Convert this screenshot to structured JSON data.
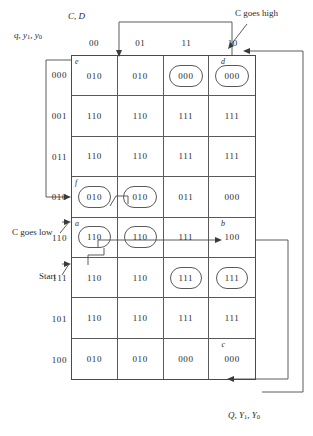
{
  "figure": {
    "caption_top_left_rows": "q, y1, y0",
    "caption_top_left_cols": "C, D",
    "caption_bottom_right": "Q, Y1, Y0"
  },
  "annotations": {
    "c_goes_high": "C goes high",
    "c_goes_low": "C goes low",
    "start": "Start"
  },
  "kmap": {
    "column_headers": [
      "00",
      "01",
      "11",
      "10"
    ],
    "row_headers": [
      "000",
      "001",
      "011",
      "010",
      "110",
      "111",
      "101",
      "100"
    ],
    "rows": [
      {
        "label": "000",
        "cells": [
          {
            "value": "010",
            "circled": false,
            "tag": "e"
          },
          {
            "value": "010",
            "circled": false,
            "tag": ""
          },
          {
            "value": "000",
            "circled": true,
            "tag": ""
          },
          {
            "value": "000",
            "circled": true,
            "tag": "d"
          }
        ]
      },
      {
        "label": "001",
        "cells": [
          {
            "value": "110",
            "circled": false,
            "tag": ""
          },
          {
            "value": "110",
            "circled": false,
            "tag": ""
          },
          {
            "value": "111",
            "circled": false,
            "tag": ""
          },
          {
            "value": "111",
            "circled": false,
            "tag": ""
          }
        ]
      },
      {
        "label": "011",
        "cells": [
          {
            "value": "110",
            "circled": false,
            "tag": ""
          },
          {
            "value": "110",
            "circled": false,
            "tag": ""
          },
          {
            "value": "111",
            "circled": false,
            "tag": ""
          },
          {
            "value": "111",
            "circled": false,
            "tag": ""
          }
        ]
      },
      {
        "label": "010",
        "cells": [
          {
            "value": "010",
            "circled": true,
            "tag": "f"
          },
          {
            "value": "010",
            "circled": true,
            "tag": ""
          },
          {
            "value": "011",
            "circled": false,
            "tag": ""
          },
          {
            "value": "000",
            "circled": false,
            "tag": ""
          }
        ]
      },
      {
        "label": "110",
        "cells": [
          {
            "value": "110",
            "circled": true,
            "tag": "a"
          },
          {
            "value": "110",
            "circled": true,
            "tag": ""
          },
          {
            "value": "111",
            "circled": false,
            "tag": ""
          },
          {
            "value": "100",
            "circled": false,
            "tag": "b"
          }
        ]
      },
      {
        "label": "111",
        "cells": [
          {
            "value": "110",
            "circled": false,
            "tag": ""
          },
          {
            "value": "110",
            "circled": false,
            "tag": ""
          },
          {
            "value": "111",
            "circled": true,
            "tag": ""
          },
          {
            "value": "111",
            "circled": true,
            "tag": ""
          }
        ]
      },
      {
        "label": "101",
        "cells": [
          {
            "value": "110",
            "circled": false,
            "tag": ""
          },
          {
            "value": "110",
            "circled": false,
            "tag": ""
          },
          {
            "value": "111",
            "circled": false,
            "tag": ""
          },
          {
            "value": "111",
            "circled": false,
            "tag": ""
          }
        ]
      },
      {
        "label": "100",
        "cells": [
          {
            "value": "010",
            "circled": false,
            "tag": ""
          },
          {
            "value": "010",
            "circled": false,
            "tag": ""
          },
          {
            "value": "000",
            "circled": false,
            "tag": ""
          },
          {
            "value": "000",
            "circled": false,
            "tag": "c"
          }
        ]
      }
    ]
  }
}
